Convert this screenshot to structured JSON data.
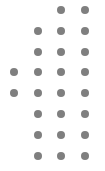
{
  "pattern": {
    "dot_color": "#7f7f7f",
    "background": "#ffffff",
    "columns_x": [
      14,
      38,
      61,
      85
    ],
    "rows_y": [
      10,
      31,
      52,
      72,
      93,
      114,
      135,
      156
    ],
    "rows": [
      [
        0,
        0,
        1,
        1
      ],
      [
        0,
        1,
        1,
        1
      ],
      [
        0,
        1,
        1,
        1
      ],
      [
        1,
        1,
        1,
        1
      ],
      [
        1,
        1,
        1,
        1
      ],
      [
        0,
        1,
        1,
        1
      ],
      [
        0,
        1,
        1,
        1
      ],
      [
        0,
        1,
        1,
        1
      ]
    ]
  }
}
